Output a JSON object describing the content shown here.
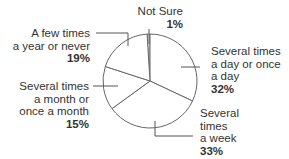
{
  "chart_data": {
    "type": "pie",
    "title": "",
    "start_angle_deg": -3.6,
    "direction": "clockwise",
    "slices": [
      {
        "label": "Not Sure",
        "value": 1,
        "pct_label": "1%"
      },
      {
        "label": "Several times a day or once a day",
        "value": 32,
        "pct_label": "32%"
      },
      {
        "label": "Several times a week",
        "value": 33,
        "pct_label": "33%"
      },
      {
        "label": "Several times a month or once a month",
        "value": 15,
        "pct_label": "15%"
      },
      {
        "label": "A few times a year or never",
        "value": 19,
        "pct_label": "19%"
      }
    ],
    "categories": [
      "Not Sure",
      "Several times a day or once a day",
      "Several times a week",
      "Several times a month or once a month",
      "A few times a year or never"
    ],
    "values": [
      1,
      32,
      33,
      15,
      19
    ],
    "legend": "none (direct labels with leader lines)"
  },
  "style": {
    "fill": "#ffffff",
    "stroke": "#666666",
    "text": "#333333"
  },
  "labels": {
    "not_sure": {
      "lines": [
        "Not Sure"
      ],
      "pct": "1%"
    },
    "daily": {
      "lines": [
        "Several times",
        "a day or once",
        "a day"
      ],
      "pct": "32%"
    },
    "weekly": {
      "lines": [
        "Several",
        "times",
        "a week"
      ],
      "pct": "33%"
    },
    "monthly": {
      "lines": [
        "Several times",
        "a month or",
        "once a month"
      ],
      "pct": "15%"
    },
    "yearly": {
      "lines": [
        "A few times",
        "a year or never"
      ],
      "pct": "19%"
    }
  }
}
